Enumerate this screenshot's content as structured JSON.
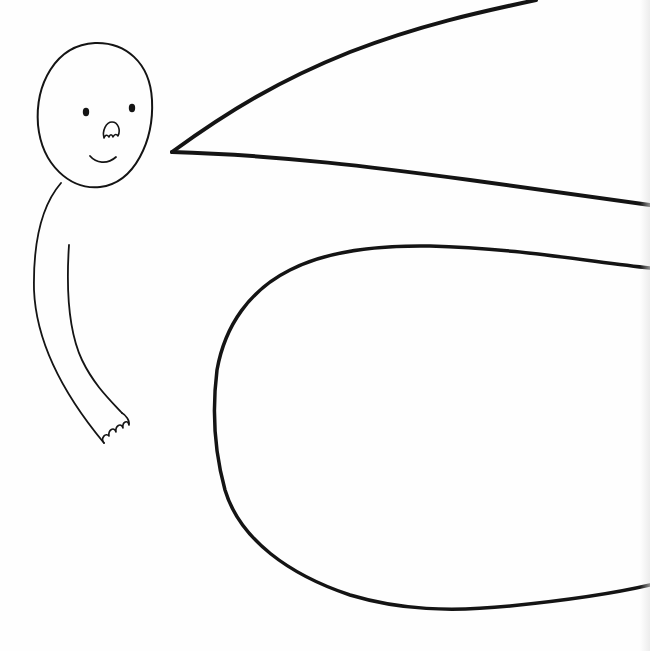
{
  "illustration": {
    "style": "hand-drawn black ink line art on white paper",
    "colors": {
      "paper": "#fefefe",
      "ink": "#141414"
    },
    "elements": [
      {
        "name": "figure-head",
        "description": "round head with two dot eyes, small nose, smiling mouth"
      },
      {
        "name": "figure-arm",
        "description": "long curved arm hanging down ending in small hand with fingers"
      },
      {
        "name": "wedge-shape",
        "description": "large pointed wedge opening to the right edge"
      },
      {
        "name": "rounded-blob",
        "description": "large rounded shape extending off the right edge"
      }
    ]
  }
}
